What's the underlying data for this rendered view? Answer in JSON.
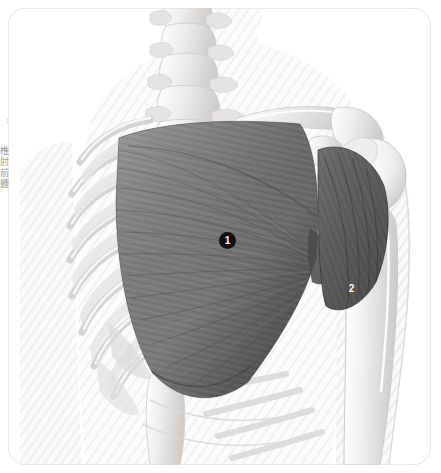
{
  "figure": {
    "modality": "grayscale anatomical illustration",
    "view": "anterior view of right hemithorax and shoulder",
    "background_color": "#ffffff",
    "card": {
      "border_color": "#d8d8d8",
      "corner_radius": "18px"
    }
  },
  "labels": [
    {
      "id": "1",
      "text": "1",
      "structure": "pectoralis major",
      "style": "filled-circle",
      "x": 227,
      "y": 240
    },
    {
      "id": "2",
      "text": "2",
      "structure": "deltoid",
      "style": "plain-numeral",
      "x": 351,
      "y": 288
    }
  ],
  "side_caption": {
    "clipped": true,
    "orientation": "vertical",
    "text": "椎肘前體",
    "small_text": "上"
  },
  "structures": {
    "skeleton_fill": "#f3f2f1",
    "bone_shade": "#d9d7d5",
    "muscle_pectoralis": "#7e7e7e",
    "muscle_pectoralis_dark": "#5d5d5d",
    "muscle_deltoid": "#6a6a6a",
    "skin_outline": "#ebeaea",
    "hatch_color": "#e2e1e0",
    "items": [
      "cervical and thoracic vertebrae",
      "clavicle",
      "acromion",
      "scapula",
      "coracoid process",
      "humeral head",
      "humerus shaft",
      "ribs 1-10",
      "costal cartilage",
      "sternum",
      "intercostal muscles",
      "pectoralis major",
      "deltoid",
      "serratus anterior"
    ]
  }
}
